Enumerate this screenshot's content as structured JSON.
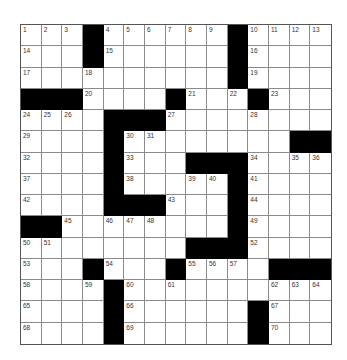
{
  "puzzle": {
    "size": {
      "rows": 15,
      "cols": 15
    },
    "colors": {
      "block": "#000000",
      "cell": "#ffffff",
      "gridline": "#8a8a8a",
      "number": "#333333"
    },
    "legend": "# = black square, . = empty white square, numbers = clue number in white square",
    "grid": [
      [
        "1",
        "2",
        "3",
        "#",
        "4",
        "5",
        "6",
        "7",
        "8",
        "9",
        "#",
        "10",
        "11",
        "12",
        "13"
      ],
      [
        "14",
        ".",
        ".",
        "#",
        "15",
        ".",
        ".",
        ".",
        ".",
        ".",
        "#",
        "16",
        ".",
        ".",
        "."
      ],
      [
        "17",
        ".",
        ".",
        "18",
        ".",
        ".",
        ".",
        ".",
        ".",
        ".",
        "#",
        "19",
        ".",
        ".",
        "."
      ],
      [
        "#",
        "#",
        "#",
        "20",
        ".",
        ".",
        ".",
        "#",
        "21",
        ".",
        "22",
        "#",
        "23",
        ".",
        "."
      ],
      [
        "24",
        "25",
        "26",
        ".",
        "#",
        "#",
        "#",
        "27",
        ".",
        ".",
        ".",
        "28",
        ".",
        ".",
        "."
      ],
      [
        "29",
        ".",
        ".",
        ".",
        "#",
        "30",
        "31",
        ".",
        ".",
        ".",
        ".",
        ".",
        ".",
        "#",
        "#"
      ],
      [
        "32",
        ".",
        ".",
        ".",
        "#",
        "33",
        ".",
        ".",
        "#",
        "#",
        "#",
        "34",
        ".",
        "35",
        "36"
      ],
      [
        "37",
        ".",
        ".",
        ".",
        "#",
        "38",
        ".",
        ".",
        "39",
        "40",
        "#",
        "41",
        ".",
        ".",
        "."
      ],
      [
        "42",
        ".",
        ".",
        ".",
        "#",
        "#",
        "#",
        "43",
        ".",
        ".",
        "#",
        "44",
        ".",
        ".",
        "."
      ],
      [
        "#",
        "#",
        "45",
        ".",
        "46",
        "47",
        "48",
        ".",
        ".",
        ".",
        "#",
        "49",
        ".",
        ".",
        "."
      ],
      [
        "50",
        "51",
        ".",
        ".",
        ".",
        ".",
        ".",
        ".",
        "#",
        "#",
        "#",
        "52",
        ".",
        ".",
        "."
      ],
      [
        "53",
        ".",
        ".",
        "#",
        "54",
        ".",
        ".",
        "#",
        "55",
        "56",
        "57",
        ".",
        "#",
        "#",
        "#"
      ],
      [
        "58",
        ".",
        ".",
        "59",
        "#",
        "60",
        ".",
        "61",
        ".",
        ".",
        ".",
        ".",
        "62",
        "63",
        "64"
      ],
      [
        "65",
        ".",
        ".",
        ".",
        "#",
        "66",
        ".",
        ".",
        ".",
        ".",
        ".",
        "#",
        "67",
        ".",
        "."
      ],
      [
        "68",
        ".",
        ".",
        ".",
        "#",
        "69",
        ".",
        ".",
        ".",
        ".",
        ".",
        "#",
        "70",
        ".",
        "."
      ]
    ]
  }
}
